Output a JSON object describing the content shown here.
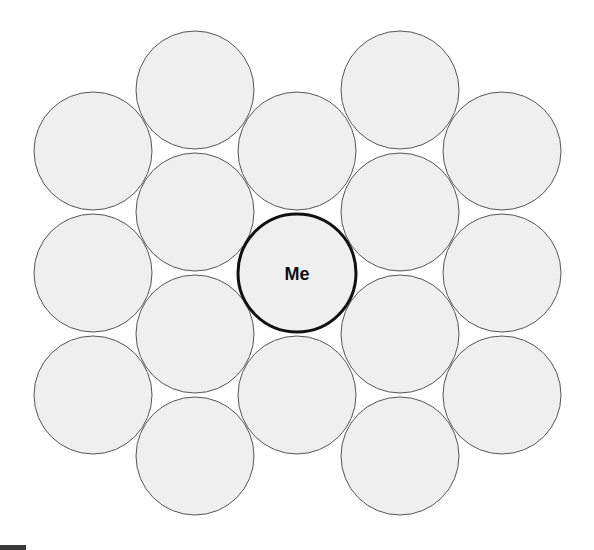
{
  "diagram": {
    "title": "",
    "center_label": "Me",
    "radius": 59,
    "colors": {
      "fill": "#efefef",
      "stroke": "#555555",
      "center_stroke": "#111111",
      "background": "#ffffff"
    },
    "circles": [
      {
        "id": "c0-0",
        "cx": 93,
        "cy": 151,
        "label": ""
      },
      {
        "id": "c0-1",
        "cx": 93,
        "cy": 273,
        "label": ""
      },
      {
        "id": "c0-2",
        "cx": 93,
        "cy": 395,
        "label": ""
      },
      {
        "id": "c1-0",
        "cx": 195,
        "cy": 90,
        "label": ""
      },
      {
        "id": "c1-1",
        "cx": 195,
        "cy": 212,
        "label": ""
      },
      {
        "id": "c1-2",
        "cx": 195,
        "cy": 334,
        "label": ""
      },
      {
        "id": "c1-3",
        "cx": 195,
        "cy": 456,
        "label": ""
      },
      {
        "id": "c2-0",
        "cx": 297,
        "cy": 151,
        "label": ""
      },
      {
        "id": "c2-2",
        "cx": 297,
        "cy": 395,
        "label": ""
      },
      {
        "id": "c3-0",
        "cx": 400,
        "cy": 90,
        "label": ""
      },
      {
        "id": "c3-1",
        "cx": 400,
        "cy": 212,
        "label": ""
      },
      {
        "id": "c3-2",
        "cx": 400,
        "cy": 334,
        "label": ""
      },
      {
        "id": "c3-3",
        "cx": 400,
        "cy": 456,
        "label": ""
      },
      {
        "id": "c4-0",
        "cx": 502,
        "cy": 151,
        "label": ""
      },
      {
        "id": "c4-1",
        "cx": 502,
        "cy": 273,
        "label": ""
      },
      {
        "id": "c4-2",
        "cx": 502,
        "cy": 395,
        "label": ""
      }
    ],
    "center": {
      "id": "me",
      "cx": 297,
      "cy": 273,
      "label": "Me"
    }
  }
}
